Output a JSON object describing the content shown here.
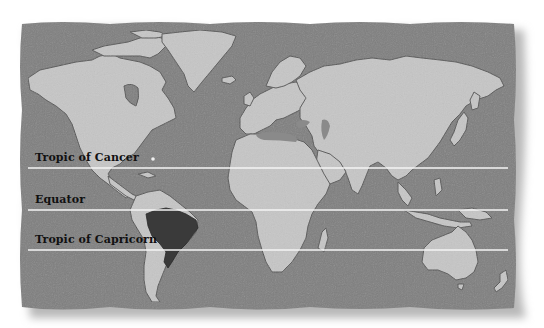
{
  "map": {
    "title": "World map with latitude lines",
    "colors": {
      "ocean": "#7f7f7f",
      "land": "#c6c6c6",
      "highlight": "#3a3a3a",
      "coast": "#555555",
      "line": "#f4f4f4",
      "label": "#111111"
    },
    "highlighted_region": "Brazil",
    "lines": [
      {
        "name": "tropic-of-cancer",
        "label": "Tropic of Cancer",
        "y": 168
      },
      {
        "name": "equator",
        "label": "Equator",
        "y": 210
      },
      {
        "name": "tropic-of-capricorn",
        "label": "Tropic of Capricorn",
        "y": 250
      }
    ]
  }
}
